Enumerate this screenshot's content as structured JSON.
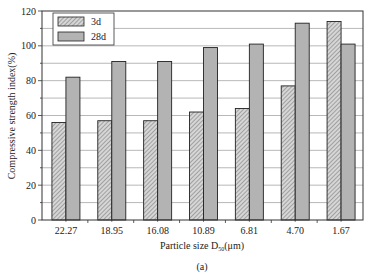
{
  "chart_data": {
    "type": "bar",
    "title": "",
    "caption": "(a)",
    "xlabel": "Particle size D50(μm)",
    "xlabel_main": "Particle size D",
    "xlabel_sub": "50",
    "xlabel_unit": "(μm)",
    "ylabel": "Compressive strength index(%)",
    "ylim": [
      0,
      120
    ],
    "yticks": [
      0,
      20,
      40,
      60,
      80,
      100,
      120
    ],
    "grid": true,
    "legend_position": "upper left",
    "categories": [
      "22.27",
      "18.95",
      "16.08",
      "10.89",
      "6.81",
      "4.70",
      "1.67"
    ],
    "series": [
      {
        "name": "3d",
        "pattern": "hatched",
        "color": "#b8b8b8",
        "values": [
          56,
          57,
          57,
          62,
          64,
          77,
          114
        ]
      },
      {
        "name": "28d",
        "pattern": "solid",
        "color": "#b3b3b3",
        "values": [
          82,
          91,
          91,
          99,
          101,
          113,
          101
        ]
      }
    ]
  }
}
